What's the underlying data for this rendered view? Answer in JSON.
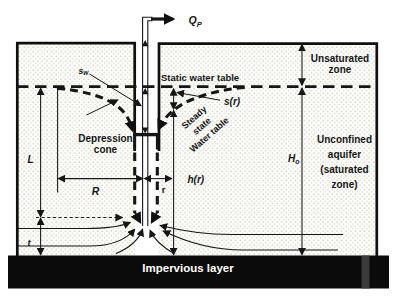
{
  "diagram": {
    "labels": {
      "qp": {
        "base": "Q",
        "sub": "P"
      },
      "sw": {
        "base": "s",
        "sub": "w"
      },
      "static_water_table": "Static water table",
      "s_r": "s(r)",
      "steady_state_lines": [
        "Steady",
        "state",
        "Water table"
      ],
      "unsaturated_zone_lines": [
        "Unsaturated",
        "zone"
      ],
      "depression_cone_lines": [
        "Depression",
        "cone"
      ],
      "unconfined_aquifer_lines": [
        "Unconfined",
        "aquifer",
        "(saturated",
        "zone)"
      ],
      "h_r": "h(r)",
      "H0": {
        "base": "H",
        "sub": "o"
      },
      "L": "L",
      "R": "R",
      "r": "r",
      "t": "t",
      "impervious_layer": "Impervious layer"
    },
    "colors": {
      "ink": "#161616",
      "paper": "#ffffff",
      "aquifer_dot": "#b4afa5",
      "aquifer_bg": "#fcfcf9",
      "impervious": "#0b0b0b",
      "impervious_text": "#ffffff"
    }
  }
}
